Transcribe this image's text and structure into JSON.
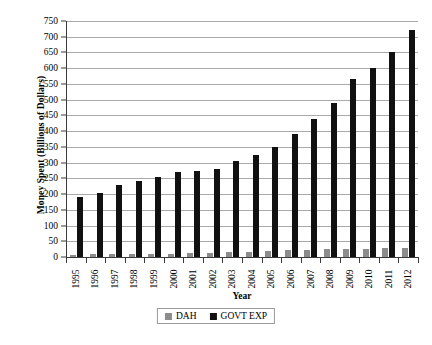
{
  "chart_data": {
    "type": "bar",
    "title": "",
    "xlabel": "Year",
    "ylabel": "Money Spent (Billions of Dollars)",
    "categories": [
      "1995",
      "1996",
      "1997",
      "1998",
      "1999",
      "2000",
      "2001",
      "2002",
      "2003",
      "2004",
      "2005",
      "2006",
      "2007",
      "2008",
      "2009",
      "2010",
      "2011",
      "2012"
    ],
    "series": [
      {
        "name": "DAH",
        "color": "#8c8c8c",
        "values": [
          7,
          8,
          9,
          9,
          10,
          11,
          12,
          13,
          15,
          17,
          19,
          21,
          23,
          25,
          26,
          27,
          28,
          28
        ]
      },
      {
        "name": "GOVT EXP",
        "color": "#111111",
        "values": [
          190,
          205,
          228,
          240,
          255,
          270,
          272,
          280,
          305,
          325,
          350,
          390,
          440,
          490,
          565,
          600,
          650,
          720
        ]
      }
    ],
    "ylim": [
      0,
      750
    ],
    "yticks": [
      0,
      50,
      100,
      150,
      200,
      250,
      300,
      350,
      400,
      450,
      500,
      550,
      600,
      650,
      700,
      750
    ],
    "grid": true,
    "legend_position": "bottom"
  },
  "legend": {
    "items": [
      {
        "label": "DAH",
        "color": "#8c8c8c"
      },
      {
        "label": "GOVT EXP",
        "color": "#111111"
      }
    ]
  }
}
